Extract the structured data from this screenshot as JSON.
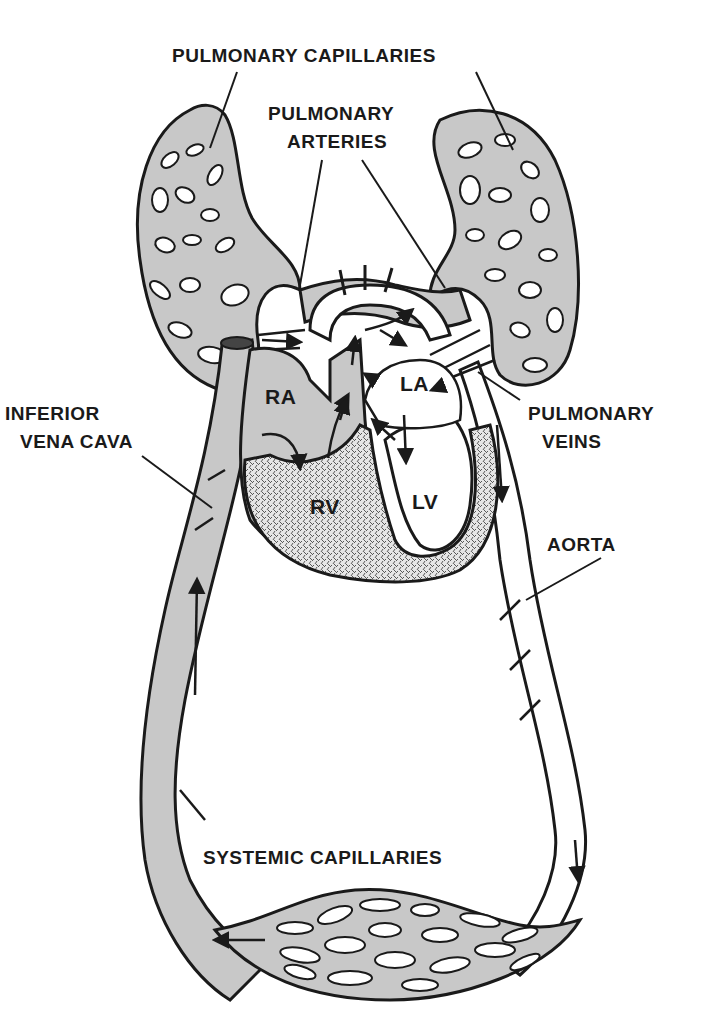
{
  "diagram": {
    "type": "circulatory-system-schematic",
    "colors": {
      "background": "#ffffff",
      "ink": "#1a1a1a",
      "vessel_fill": "#c8c8c8",
      "capillary_hole": "#ffffff",
      "myocardium_fill": "#e4e4e4"
    },
    "labels": {
      "pulmonary_capillaries": "PULMONARY CAPILLARIES",
      "pulmonary_arteries_line1": "PULMONARY",
      "pulmonary_arteries_line2": "ARTERIES",
      "inferior_vena_cava_line1": "INFERIOR",
      "inferior_vena_cava_line2": "VENA CAVA",
      "pulmonary_veins_line1": "PULMONARY",
      "pulmonary_veins_line2": "VEINS",
      "aorta": "AORTA",
      "systemic_capillaries": "SYSTEMIC CAPILLARIES"
    },
    "chambers": {
      "ra": "RA",
      "rv": "RV",
      "la": "LA",
      "lv": "LV"
    }
  }
}
